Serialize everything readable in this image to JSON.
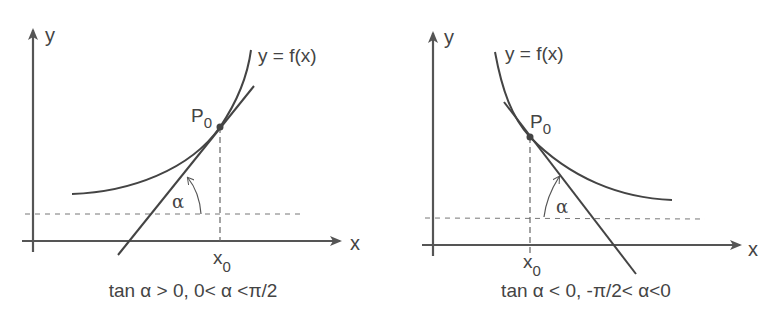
{
  "diagrams": [
    {
      "id": "increasing",
      "y_label": "y",
      "x_label": "x",
      "curve_label": "y = f(x)",
      "point_label": "P",
      "point_sub": "0",
      "x0_label": "x",
      "x0_sub": "0",
      "angle_label": "α",
      "caption": "tan α > 0, 0< α <π/2"
    },
    {
      "id": "decreasing",
      "y_label": "y",
      "x_label": "x",
      "curve_label": "y = f(x)",
      "point_label": "P",
      "point_sub": "0",
      "x0_label": "x",
      "x0_sub": "0",
      "angle_label": "α",
      "caption": "tan α < 0, -π/2< α<0"
    }
  ],
  "colors": {
    "stroke": "#444444",
    "dash": "#666666"
  }
}
